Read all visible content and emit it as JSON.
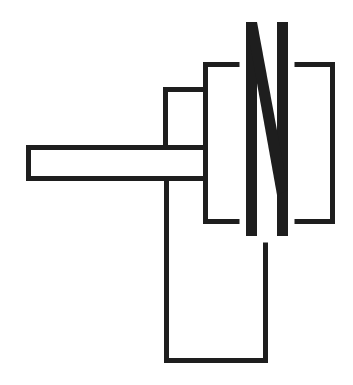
{
  "diagram": {
    "title": "",
    "width": 353,
    "height": 385,
    "stroke_color": "#1e1e1e",
    "background": "#ffffff",
    "stroke_width": 5,
    "elements": {
      "horizontal_bar": {
        "x": 26,
        "y": 145,
        "w": 182,
        "h": 36
      },
      "upper_box": {
        "x": 163,
        "y": 87,
        "w": 45,
        "h": 58
      },
      "lower_loop": {
        "x_left": 166.5,
        "x_right": 265.5,
        "y_top": 181,
        "y_top_right": 244,
        "y_bottom": 360.5
      },
      "left_bracket": {
        "x": 205.5,
        "y_top": 64.5,
        "y_bottom": 221.5,
        "arm_end": 238
      },
      "right_bracket": {
        "x": 332.5,
        "y_top": 64.5,
        "y_bottom": 221.5,
        "arm_start": 296
      },
      "letter_n": {
        "label": "N",
        "left_x1": 246,
        "left_x2": 257,
        "right_x1": 277,
        "right_x2": 288,
        "y_top": 22,
        "y_bottom": 236
      }
    }
  }
}
